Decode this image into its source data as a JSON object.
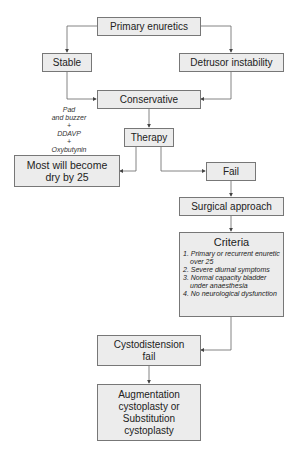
{
  "nodes": {
    "primary": "Primary enuretics",
    "stable": "Stable",
    "detrusor": "Detrusor instability",
    "conservative": "Conservative",
    "therapy": "Therapy",
    "dry_line1": "Most will become",
    "dry_line2": "dry by 25",
    "fail": "Fail",
    "surgical": "Surgical approach",
    "criteria_title": "Criteria",
    "criteria_items": [
      "1. Primary or recurrent enuretic over 25",
      "2. Severe diurnal symptoms",
      "3. Normal capacity bladder under anaesthesia",
      "4. No neurological dysfunction"
    ],
    "cysto_line1": "Cystodistension",
    "cysto_line2": "fail",
    "aug_line1": "Augmentation",
    "aug_line2": "cystoplasty or",
    "aug_line3": "Substitution",
    "aug_line4": "cystoplasty"
  },
  "therapy_note": {
    "line1": "Pad",
    "line2": "and buzzer",
    "line3": "+",
    "line4": "DDAVP",
    "line5": "+",
    "line6": "Oxybutynin"
  },
  "colors": {
    "box_fill": "#ececec",
    "box_border": "#777777",
    "line": "#555555"
  }
}
